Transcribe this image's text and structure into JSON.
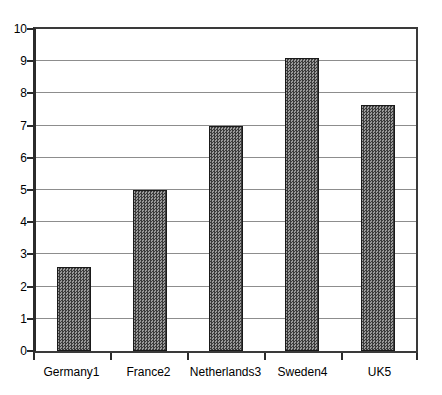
{
  "chart_data": {
    "type": "bar",
    "title": "",
    "xlabel": "",
    "ylabel": "",
    "categories": [
      "Germany1",
      "France2",
      "Netherlands3",
      "Sweden4",
      "UK5"
    ],
    "values": [
      2.6,
      5.0,
      7.0,
      9.1,
      7.65
    ],
    "ylim": [
      0,
      10
    ],
    "ytick_labels": [
      "10",
      "9",
      "8",
      "7",
      "6",
      "5",
      "4",
      "3",
      "2",
      "1",
      "0"
    ],
    "ytick_values": [
      10,
      9,
      8,
      7,
      6,
      5,
      4,
      3,
      2,
      1,
      0
    ],
    "grid": true,
    "legend": "none",
    "series": [
      {
        "name": "",
        "values": [
          2.6,
          5.0,
          7.0,
          9.1,
          7.65
        ]
      }
    ]
  },
  "style": {
    "bar_fill": "#6f6f6f",
    "bar_edge": "#1a1a1a",
    "gridline_color": "#8d8d8d",
    "axis_color": "#2b2b2b",
    "background": "#ffffff",
    "text_color": "#000000"
  }
}
